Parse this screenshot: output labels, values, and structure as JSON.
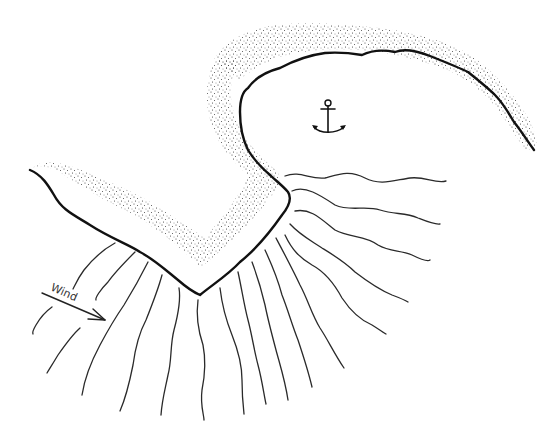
{
  "diagram": {
    "labels": {
      "wind": "Wind"
    },
    "icons": {
      "anchorage": "anchor-icon",
      "wind_direction": "arrow-right-down-icon"
    },
    "colors": {
      "background": "#ffffff",
      "coastline": "#111111",
      "waves": "#2a2a2a",
      "sand": "#3a3a3a"
    },
    "elements": [
      {
        "type": "coastline",
        "name": "left-shore"
      },
      {
        "type": "coastline",
        "name": "headland-and-bay-shore"
      },
      {
        "type": "beach-stipple",
        "name": "sand-band"
      },
      {
        "type": "anchor-symbol",
        "name": "anchorage-marker"
      },
      {
        "type": "wave-crests",
        "name": "refracted-waves",
        "count": 17
      },
      {
        "type": "arrow",
        "name": "wind-arrow",
        "label": "Wind"
      }
    ]
  }
}
